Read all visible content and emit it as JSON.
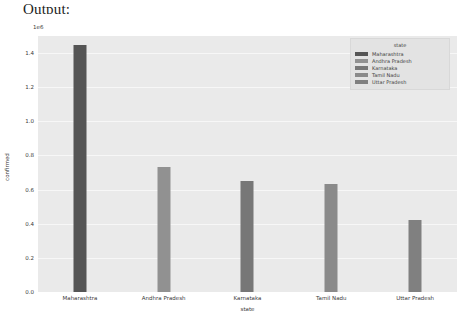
{
  "notebook": {
    "output_label": "Output:"
  },
  "chart_data": {
    "type": "bar",
    "title": "",
    "xlabel": "state",
    "ylabel": "confirmed",
    "y_exponent_label": "1e6",
    "y_multiplier": 1000000,
    "ylim": [
      0,
      1.5
    ],
    "yticks": [
      "0.0",
      "0.2",
      "0.4",
      "0.6",
      "0.8",
      "1.0",
      "1.2",
      "1.4"
    ],
    "ytick_values": [
      0.0,
      0.2,
      0.4,
      0.6,
      0.8,
      1.0,
      1.2,
      1.4
    ],
    "grid": true,
    "categories": [
      "Maharashtra",
      "Andhra Pradesh",
      "Karnataka",
      "Tamil Nadu",
      "Uttar Pradesh"
    ],
    "values": [
      1.45,
      0.73,
      0.65,
      0.63,
      0.42
    ],
    "bar_colors": [
      "#555555",
      "#919191",
      "#777777",
      "#8a8a8a",
      "#808080"
    ],
    "legend": {
      "title": "state",
      "position": "upper right",
      "entries": [
        {
          "label": "Maharashtra",
          "color": "#555555"
        },
        {
          "label": "Andhra Pradesh",
          "color": "#919191"
        },
        {
          "label": "Karnataka",
          "color": "#777777"
        },
        {
          "label": "Tamil Nadu",
          "color": "#8a8a8a"
        },
        {
          "label": "Uttar Pradesh",
          "color": "#808080"
        }
      ]
    },
    "style": {
      "axes_background": "#eaeaea",
      "grid_color": "#f7f7f7",
      "figure_background": "#ffffff"
    }
  }
}
